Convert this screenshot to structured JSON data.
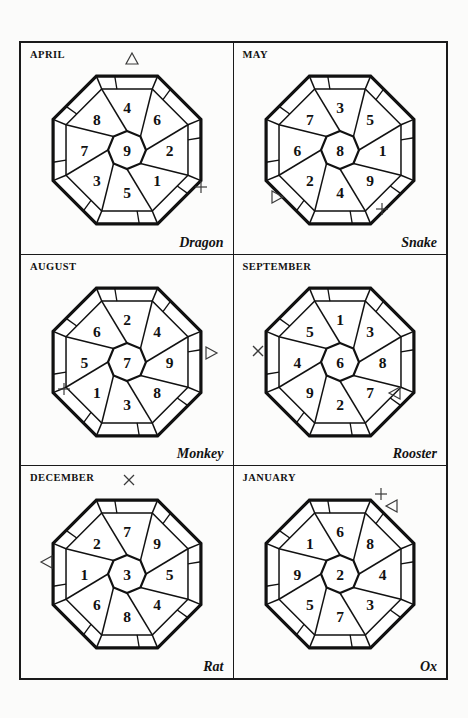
{
  "page": {
    "background_color": "#fbfbfa",
    "border_color": "#1a1a1a",
    "ink_color": "#111111",
    "marker_color": "#3b3b3b"
  },
  "cells": [
    {
      "month": "APRIL",
      "zodiac": "Dragon",
      "center": "9",
      "ring": {
        "n": "4",
        "ne": "6",
        "e": "2",
        "se": "1",
        "s": "5",
        "sw": "3",
        "w": "7",
        "nw": "8"
      },
      "markers": [
        {
          "glyph": "triangle-up",
          "x": 103,
          "y": 8
        },
        {
          "glyph": "plus",
          "x": 172,
          "y": 136
        }
      ]
    },
    {
      "month": "MAY",
      "zodiac": "Snake",
      "center": "8",
      "ring": {
        "n": "3",
        "ne": "5",
        "e": "1",
        "se": "9",
        "s": "4",
        "sw": "2",
        "w": "6",
        "nw": "7"
      },
      "markers": [
        {
          "glyph": "triangle-right",
          "x": 36,
          "y": 146
        },
        {
          "glyph": "plus",
          "x": 140,
          "y": 158
        }
      ]
    },
    {
      "month": "AUGUST",
      "zodiac": "Monkey",
      "center": "7",
      "ring": {
        "n": "2",
        "ne": "4",
        "e": "9",
        "se": "8",
        "s": "3",
        "sw": "1",
        "w": "5",
        "nw": "6"
      },
      "markers": [
        {
          "glyph": "triangle-right",
          "x": 183,
          "y": 90
        },
        {
          "glyph": "plus",
          "x": 35,
          "y": 126
        }
      ]
    },
    {
      "month": "SEPTEMBER",
      "zodiac": "Rooster",
      "center": "6",
      "ring": {
        "n": "1",
        "ne": "3",
        "e": "8",
        "se": "7",
        "s": "2",
        "sw": "9",
        "w": "4",
        "nw": "5"
      },
      "markers": [
        {
          "glyph": "times",
          "x": 16,
          "y": 88
        },
        {
          "glyph": "triangle-left",
          "x": 152,
          "y": 130
        }
      ]
    },
    {
      "month": "DECEMBER",
      "zodiac": "Rat",
      "center": "3",
      "ring": {
        "n": "7",
        "ne": "9",
        "e": "5",
        "se": "4",
        "s": "8",
        "sw": "6",
        "w": "1",
        "nw": "2"
      },
      "markers": [
        {
          "glyph": "times",
          "x": 100,
          "y": 6
        },
        {
          "glyph": "triangle-left",
          "x": 17,
          "y": 88
        }
      ]
    },
    {
      "month": "JANUARY",
      "zodiac": "Ox",
      "center": "2",
      "ring": {
        "n": "6",
        "ne": "8",
        "e": "4",
        "se": "3",
        "s": "7",
        "sw": "5",
        "w": "9",
        "nw": "1"
      },
      "markers": [
        {
          "glyph": "plus",
          "x": 139,
          "y": 20
        },
        {
          "glyph": "triangle-left",
          "x": 149,
          "y": 32
        }
      ]
    }
  ]
}
